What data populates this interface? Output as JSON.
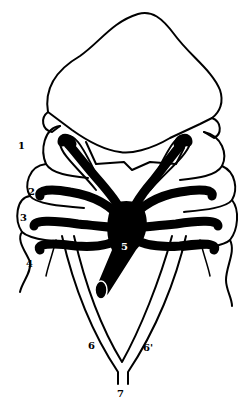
{
  "figure": {
    "type": "anatomical line drawing",
    "colors": {
      "ink": "#000000",
      "background": "#ffffff"
    },
    "labels": [
      {
        "id": "1",
        "text": "1"
      },
      {
        "id": "2",
        "text": "2"
      },
      {
        "id": "3",
        "text": "3"
      },
      {
        "id": "4",
        "text": "4"
      },
      {
        "id": "5",
        "text": "5"
      },
      {
        "id": "6",
        "text": "6"
      },
      {
        "id": "6p",
        "text": "6'"
      },
      {
        "id": "7",
        "text": "7"
      }
    ]
  }
}
